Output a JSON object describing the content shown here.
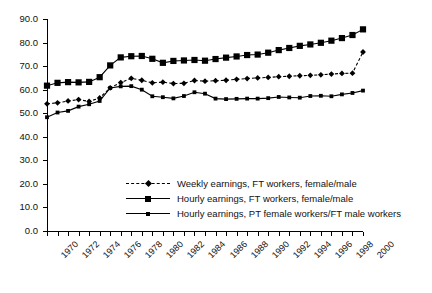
{
  "chart_data": {
    "type": "line",
    "title": "",
    "xlabel": "",
    "ylabel": "",
    "ylim": [
      0,
      90
    ],
    "ytick_values": [
      0,
      10,
      20,
      30,
      40,
      50,
      60,
      70,
      80,
      90
    ],
    "ytick_labels": [
      "0.0",
      "10.0",
      "20.0",
      "30.0",
      "40.0",
      "50.0",
      "60.0",
      "70.0",
      "80.0",
      "90.0"
    ],
    "xlim": [
      1970,
      2000
    ],
    "x": [
      1970,
      1971,
      1972,
      1973,
      1974,
      1975,
      1976,
      1977,
      1978,
      1979,
      1980,
      1981,
      1982,
      1983,
      1984,
      1985,
      1986,
      1987,
      1988,
      1989,
      1990,
      1991,
      1992,
      1993,
      1994,
      1995,
      1996,
      1997,
      1998,
      1999,
      2000
    ],
    "xtick_labels": [
      "1970",
      "1972",
      "1974",
      "1976",
      "1978",
      "1980",
      "1982",
      "1984",
      "1986",
      "1988",
      "1990",
      "1992",
      "1994",
      "1996",
      "1998",
      "2000"
    ],
    "xtick_label_step": 2,
    "minor_ticks_every": 1,
    "grid": false,
    "legend_position": "inside-center-bottom",
    "series": [
      {
        "name": "Weekly earnings, FT workers, female/male",
        "marker": "diamond",
        "linestyle": "dashed",
        "color": "#000000",
        "values": [
          54.0,
          54.4,
          55.2,
          55.8,
          55.0,
          56.5,
          60.8,
          63.0,
          64.8,
          64.0,
          62.9,
          63.2,
          62.6,
          62.7,
          63.9,
          63.6,
          63.8,
          64.0,
          64.4,
          64.7,
          65.0,
          65.2,
          65.5,
          65.7,
          65.9,
          66.1,
          66.3,
          66.6,
          66.9,
          67.0,
          76.0
        ]
      },
      {
        "name": "Hourly earnings, FT workers, female/male",
        "marker": "square-large",
        "linestyle": "solid",
        "color": "#000000",
        "values": [
          61.7,
          62.9,
          63.2,
          63.1,
          63.3,
          65.3,
          70.3,
          73.7,
          74.2,
          74.3,
          73.1,
          71.4,
          72.2,
          72.4,
          72.6,
          72.3,
          73.0,
          73.6,
          74.1,
          74.7,
          74.9,
          75.7,
          76.8,
          77.7,
          78.6,
          79.2,
          79.9,
          80.8,
          81.9,
          83.2,
          85.6
        ]
      },
      {
        "name": "Hourly earnings, PT female workers/FT male workers",
        "marker": "square-small",
        "linestyle": "solid",
        "color": "#000000",
        "values": [
          48.3,
          50.3,
          51.0,
          52.8,
          53.8,
          55.2,
          60.7,
          61.4,
          61.5,
          60.0,
          57.2,
          56.8,
          56.3,
          57.3,
          58.9,
          58.3,
          56.2,
          56.0,
          56.1,
          56.2,
          56.2,
          56.4,
          56.9,
          56.7,
          56.6,
          57.3,
          57.4,
          57.2,
          58.0,
          58.6,
          59.6
        ]
      }
    ]
  },
  "legend": {
    "items": [
      {
        "label": "Weekly earnings, FT workers, female/male"
      },
      {
        "label": "Hourly earnings, FT workers, female/male"
      },
      {
        "label": "Hourly earnings, PT female workers/FT male workers"
      }
    ]
  }
}
